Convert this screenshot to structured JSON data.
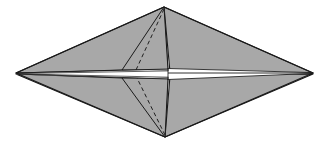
{
  "figure": {
    "type": "geometric-line-drawing",
    "canvas": {
      "width": 331,
      "height": 150,
      "background": "#ffffff"
    },
    "colors": {
      "paper_fill": "#a8a8a8",
      "paper_fill_shaded": "#9e9e9e",
      "highlight_white": "#ffffff",
      "outline_stroke": "#1a1a1a",
      "fold_dashed_stroke": "#1f1f1f",
      "crease_thin_stroke": "#2b2b2b"
    },
    "stroke_widths": {
      "outline": 1.1,
      "crease": 0.9,
      "dashed": 1.0
    },
    "dash_pattern": "4,3",
    "anchor_points": {
      "left_tip": [
        16,
        73
      ],
      "right_tip": [
        313,
        73
      ],
      "top_vertex": [
        164,
        7
      ],
      "bottom_vertex": [
        165,
        137
      ],
      "upper_flap_left": [
        122,
        70
      ],
      "upper_flap_apex": [
        164,
        7
      ],
      "lower_flap_left": [
        122,
        78
      ],
      "lower_flap_apex": [
        165,
        137
      ],
      "slit_left": [
        16,
        73
      ],
      "slit_right": [
        313,
        73
      ],
      "notch_center": [
        168,
        74
      ]
    },
    "shapes": {
      "upper_left_wing": "16,73 164,7 168,70 122,70",
      "upper_right_wing": "164,7 313,73 170,72",
      "lower_left_wing": "16,74 122,78 168,78 165,137",
      "lower_right_wing": "165,137 313,74 170,76",
      "upper_inner_flap": "122,70 164,7 168,70",
      "lower_inner_flap": "122,78 165,137 168,78",
      "upper_dashed_fold": "164,7 136,70",
      "lower_dashed_fold": "165,137 137,78",
      "white_wedge_right": "170,69 313,73 170,79",
      "white_slit_core": "16,73 313,73"
    },
    "crease_lines": [
      {
        "name": "upper-left-spine",
        "from": [
          16,
          73
        ],
        "to": [
          168,
          69
        ]
      },
      {
        "name": "upper-left-spine-b",
        "from": [
          16,
          74
        ],
        "to": [
          160,
          72
        ]
      },
      {
        "name": "lower-left-spine",
        "from": [
          16,
          74
        ],
        "to": [
          168,
          79
        ]
      },
      {
        "name": "lower-left-spine-b",
        "from": [
          20,
          74
        ],
        "to": [
          160,
          77
        ]
      },
      {
        "name": "right-axis",
        "from": [
          170,
          73
        ],
        "to": [
          313,
          73
        ]
      }
    ],
    "element_labels": {
      "canvas": "figure-canvas",
      "upper_left_wing": "upper-left-wing-panel",
      "upper_right_wing": "upper-right-wing-panel",
      "lower_left_wing": "lower-left-wing-panel",
      "lower_right_wing": "lower-right-wing-panel",
      "upper_inner_flap": "upper-inner-flap-panel",
      "lower_inner_flap": "lower-inner-flap-panel",
      "upper_dashed_fold": "upper-dashed-fold-line",
      "lower_dashed_fold": "lower-dashed-fold-line",
      "white_wedge": "center-white-wedge",
      "center_slit": "center-horizontal-slit"
    }
  }
}
